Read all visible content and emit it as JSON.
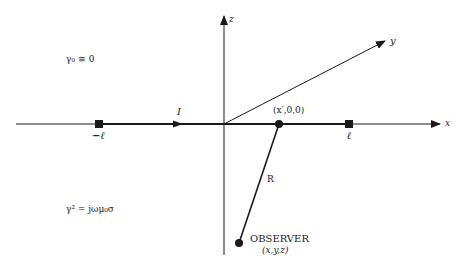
{
  "diagram": {
    "axes": {
      "x_label": "x",
      "y_label": "y",
      "z_label": "z"
    },
    "wire": {
      "left_end_label": "−ℓ",
      "right_end_label": "ℓ",
      "current_label": "I"
    },
    "source_point": {
      "label": "(x′,0,0)"
    },
    "distance": {
      "label": "R"
    },
    "observer": {
      "label": "OBSERVER",
      "coords": "(x,y,z)"
    },
    "regions": {
      "upper_medium": "γ₀ ≅ 0",
      "lower_medium": "γ² = jωμ₀σ"
    },
    "colors": {
      "line": "#1a1a1a",
      "background": "#ffffff"
    }
  }
}
